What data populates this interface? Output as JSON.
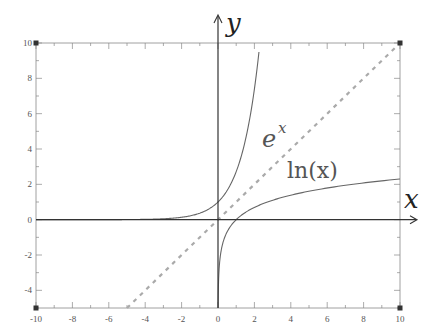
{
  "chart_data": {
    "type": "line",
    "title": "",
    "xlabel": "x",
    "ylabel": "y",
    "xlim": [
      -10,
      10
    ],
    "ylim": [
      -5,
      10
    ],
    "grid": false,
    "x_ticks": [
      "-10",
      "-8",
      "-6",
      "-4",
      "-2",
      "0",
      "2",
      "4",
      "6",
      "8",
      "10"
    ],
    "y_ticks": [
      "-4",
      "-2",
      "0",
      "2",
      "4",
      "6",
      "8",
      "10"
    ],
    "series": [
      {
        "name": "e^x",
        "label": "e",
        "label_sup": "x",
        "style": "solid",
        "color": "#666666",
        "points": [
          [
            -10,
            5e-05
          ],
          [
            -4,
            0.018
          ],
          [
            -2,
            0.135
          ],
          [
            -1,
            0.368
          ],
          [
            0,
            1
          ],
          [
            1,
            2.718
          ],
          [
            2,
            7.389
          ],
          [
            2.3,
            9.97
          ]
        ]
      },
      {
        "name": "ln(x)",
        "label": "ln(x)",
        "style": "solid",
        "color": "#666666",
        "points": [
          [
            0.007,
            -5
          ],
          [
            0.05,
            -3
          ],
          [
            0.2,
            -1.61
          ],
          [
            0.5,
            -0.69
          ],
          [
            1,
            0
          ],
          [
            2,
            0.69
          ],
          [
            4,
            1.39
          ],
          [
            6,
            1.79
          ],
          [
            8,
            2.08
          ],
          [
            10,
            2.3
          ]
        ]
      },
      {
        "name": "y = x",
        "label": "",
        "style": "dashed",
        "color": "#aaaaaa",
        "points": [
          [
            -5,
            -5
          ],
          [
            10,
            10
          ]
        ]
      }
    ],
    "annotations": [
      {
        "text": "e^x",
        "x": 3.0,
        "y": 5.5
      },
      {
        "text": "ln(x)",
        "x": 6.5,
        "y": 3.0
      }
    ],
    "corner_markers": [
      [
        -10,
        10
      ],
      [
        10,
        10
      ],
      [
        -10,
        -5
      ],
      [
        10,
        -5
      ]
    ]
  }
}
